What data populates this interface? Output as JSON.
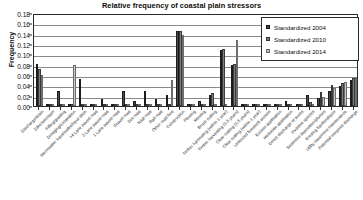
{
  "chart_data": {
    "type": "bar",
    "title": "Relative frequency of coastal plain stressors",
    "xlabel": "",
    "ylabel": "Frequency",
    "ylim": [
      0,
      0.18
    ],
    "ytick_labels": [
      "0.18",
      "0.16",
      "0.14",
      "0.12",
      "0.10",
      "0.08",
      "0.06",
      "0.04",
      "0.02",
      "0.00"
    ],
    "ytick_values": [
      0.18,
      0.16,
      0.14,
      0.12,
      0.1,
      0.08,
      0.06,
      0.04,
      0.02,
      0.0
    ],
    "grid": true,
    "legend_position": "top-right",
    "categories": [
      "Discharge/drain",
      "Dike/weir/dam",
      "Filling/grading",
      "Dredging/excavation",
      "Stormwater input/outlet/input ditch",
      ">4 Lane paved road",
      "2 Lane paved road",
      "1 Lane paved road",
      "Gravel road",
      "Dirt road",
      "Total road",
      "Rail road",
      "Other road bed",
      "Construction",
      "Plowing",
      "Mowing",
      "Brush cutting",
      "Timber harvesting (within 1 year)",
      "Timber harvesting (1-5 years)",
      "Clear cutting (1-5 years)",
      "Clear cutting (within 1 year)",
      "Unfenced livestock access",
      "Excess application",
      "Herbicide application",
      "Direct discharge of toxics",
      "Invasive species",
      "Sediment deposition/plumes",
      "Eroding banks/slopes",
      "Utility easement maintenance",
      "Potential nonpoint discharge"
    ],
    "series": [
      {
        "name": "Standardized 2004",
        "color": "#4a4a4a",
        "values": [
          0.081,
          0.0,
          0.029,
          0.0,
          0.053,
          0.0,
          0.014,
          0.0,
          0.029,
          0.009,
          0.029,
          0.014,
          0.022,
          0.145,
          0.0,
          0.009,
          0.022,
          0.108,
          0.08,
          0.0,
          0.0,
          0.0,
          0.0,
          0.009,
          0.0,
          0.022,
          0.015,
          0.03,
          0.038,
          0.05
        ]
      },
      {
        "name": "Standardized 2010",
        "color": "#7d7d7d",
        "values": [
          0.072,
          0.0,
          0.0,
          0.0,
          0.0,
          0.0,
          0.0,
          0.0,
          0.0,
          0.0,
          0.0,
          0.0,
          0.0,
          0.145,
          0.0,
          0.0,
          0.025,
          0.11,
          0.082,
          0.0,
          0.0,
          0.0,
          0.0,
          0.0,
          0.0,
          0.008,
          0.028,
          0.04,
          0.044,
          0.055
        ]
      },
      {
        "name": "Standardized 2014",
        "color": "#c6c6c6",
        "values": [
          0.06,
          0.0,
          0.0,
          0.08,
          0.0,
          0.0,
          0.0,
          0.0,
          0.0,
          0.0,
          0.0,
          0.0,
          0.05,
          0.138,
          0.0,
          0.0,
          0.0,
          0.0,
          0.128,
          0.0,
          0.0,
          0.0,
          0.0,
          0.0,
          0.0,
          0.0,
          0.018,
          0.034,
          0.046,
          0.057
        ]
      }
    ]
  },
  "legend": {
    "entries": [
      {
        "label": "Standardized 2004"
      },
      {
        "label": "Standardized 2010"
      },
      {
        "label": "Standardized 2014"
      }
    ]
  }
}
